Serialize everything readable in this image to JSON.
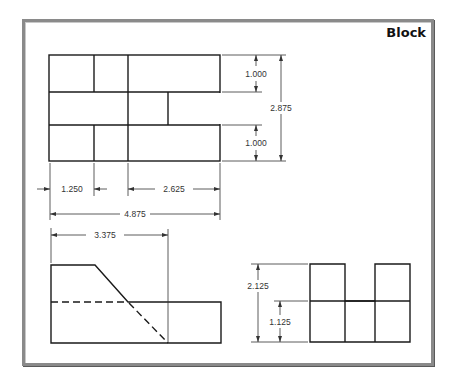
{
  "title": "Block",
  "views": {
    "top": {
      "dimensions": {
        "top_row_height": "1.000",
        "bottom_row_height": "1.000",
        "overall_height": "2.875",
        "left_width": "1.250",
        "right_width": "2.625",
        "overall_width": "4.875"
      }
    },
    "front": {
      "dimensions": {
        "slope_width": "3.375"
      }
    },
    "side": {
      "dimensions": {
        "overall_height": "2.125",
        "base_height": "1.125"
      }
    }
  },
  "colors": {
    "line": "#1a1a1a",
    "frame": "#8a8a8a",
    "background": "#ffffff"
  }
}
